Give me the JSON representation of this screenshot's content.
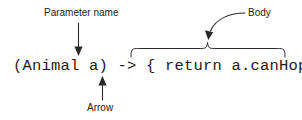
{
  "diagram": {
    "background_color": "#ffffff",
    "ink_color": "#2a2a2a",
    "code": {
      "full_text": "(Animal a) -> { return a.canHop(); }",
      "tokens": {
        "parameter": "(Animal a)",
        "arrow": "->",
        "body": "{ return a.canHop(); }"
      }
    },
    "annotations": [
      {
        "id": "parameter-name",
        "label": "Parameter name",
        "connector": "straight-arrow-down",
        "points_to": "a"
      },
      {
        "id": "arrow",
        "label": "Arrow",
        "connector": "straight-arrow-up",
        "points_to": "->"
      },
      {
        "id": "body",
        "label": "Body",
        "connector": "curved-arrow-down-left",
        "points_to": "{ return a.canHop(); }"
      }
    ],
    "brace": {
      "orientation": "horizontal-top",
      "spans": "{ return a.canHop(); }"
    }
  }
}
